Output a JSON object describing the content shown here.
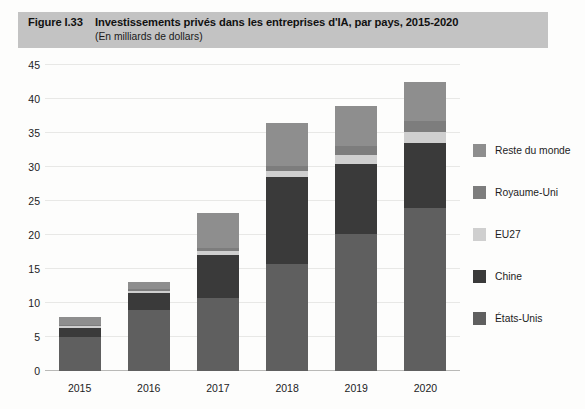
{
  "figure": {
    "number_label": "Figure I.33",
    "title": "Investissements privés dans les entreprises d'IA, par pays, 2015-2020",
    "subtitle": "(En milliards de dollars)",
    "band_color": "#c3c3c3"
  },
  "legend": {
    "position": "right",
    "items": [
      {
        "label": "Reste du monde",
        "color": "#8e8e8e"
      },
      {
        "label": "Royaume-Uni",
        "color": "#7d7d7d"
      },
      {
        "label": "EU27",
        "color": "#cfcfcf"
      },
      {
        "label": "Chine",
        "color": "#3a3a3a"
      },
      {
        "label": "États-Unis",
        "color": "#5f5f5f"
      }
    ]
  },
  "chart_data": {
    "type": "bar",
    "stacked": true,
    "title": "Investissements privés dans les entreprises d'IA, par pays, 2015-2020",
    "subtitle": "(En milliards de dollars)",
    "xlabel": "",
    "ylabel": "",
    "ylim": [
      0,
      45
    ],
    "yticks": [
      0,
      5,
      10,
      15,
      20,
      25,
      30,
      35,
      40,
      45
    ],
    "ytick_labels": [
      "0",
      "5",
      "10",
      "15",
      "20",
      "25",
      "30",
      "35",
      "40",
      "45"
    ],
    "grid": true,
    "categories": [
      "2015",
      "2016",
      "2017",
      "2018",
      "2019",
      "2020"
    ],
    "series": [
      {
        "name": "États-Unis",
        "color": "#5f5f5f",
        "values": [
          5.0,
          9.0,
          10.8,
          15.7,
          20.2,
          23.9
        ]
      },
      {
        "name": "Chine",
        "color": "#3a3a3a",
        "values": [
          1.3,
          2.5,
          6.2,
          12.8,
          10.2,
          9.7
        ]
      },
      {
        "name": "EU27",
        "color": "#cfcfcf",
        "values": [
          0.3,
          0.3,
          0.6,
          0.9,
          1.4,
          1.6
        ]
      },
      {
        "name": "Royaume-Uni",
        "color": "#7d7d7d",
        "values": [
          0.2,
          0.3,
          0.5,
          0.8,
          1.3,
          1.5
        ]
      },
      {
        "name": "Reste du monde",
        "color": "#8e8e8e",
        "values": [
          1.2,
          1.0,
          5.1,
          6.3,
          5.9,
          5.8
        ]
      }
    ],
    "totals": [
      8.0,
      13.1,
      23.2,
      36.5,
      39.0,
      42.5
    ]
  }
}
